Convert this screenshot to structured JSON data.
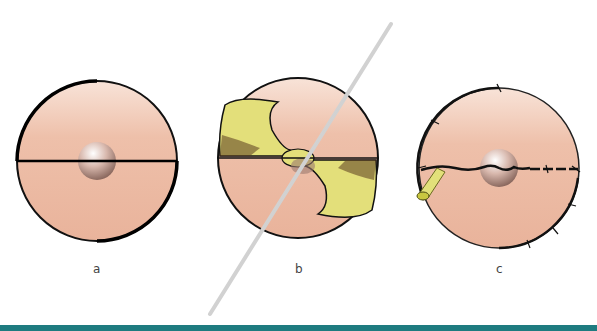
{
  "figure": {
    "panels": [
      {
        "id": "a",
        "label": "a",
        "description": "circular skin defect with straight horizontal incision line and central nodule"
      },
      {
        "id": "b",
        "label": "b",
        "description": "S-shaped flap elevation with needle/probe passing diagonally through"
      },
      {
        "id": "c",
        "label": "c",
        "description": "closure with sutures along circumference and horizontal line, with drain on left"
      }
    ]
  },
  "colors": {
    "skin": "#eab39c",
    "skin_light": "#f6d7c8",
    "tissue_yellow": "#e3e07a",
    "outline": "#111111",
    "bar": "#1e7b80",
    "needle": "#d4d4d4"
  }
}
